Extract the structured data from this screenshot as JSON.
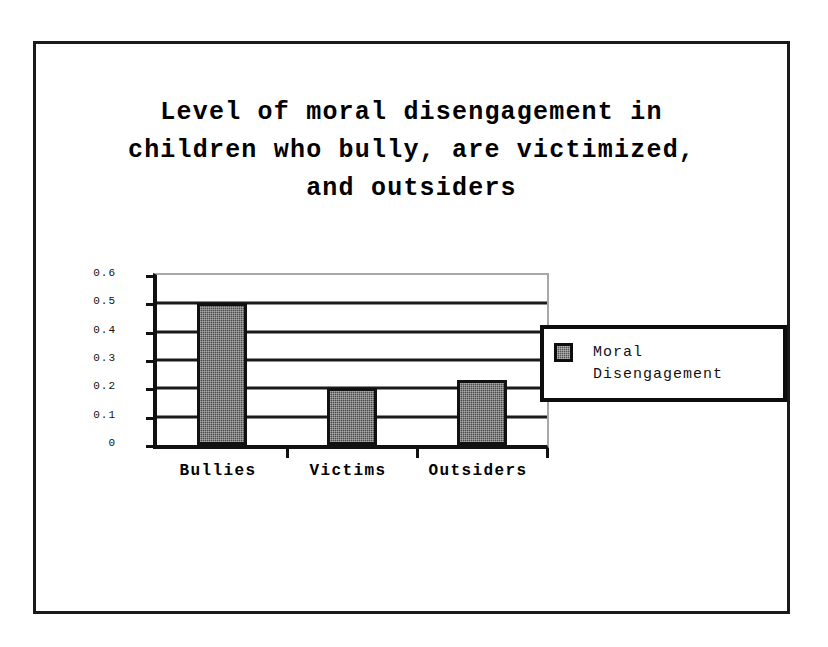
{
  "chart_data": {
    "type": "bar",
    "title": "Level of moral disengagement in\nchildren who bully, are victimized,\nand outsiders",
    "categories": [
      "Bullies",
      "Victims",
      "Outsiders"
    ],
    "values": [
      0.5,
      0.2,
      0.23
    ],
    "series": [
      {
        "name": "Moral Disengagement",
        "values": [
          0.5,
          0.2,
          0.23
        ]
      }
    ],
    "xlabel": "",
    "ylabel": "",
    "ylim": [
      0,
      0.6
    ],
    "ytick_labels": [
      "0.6",
      "0.5",
      "0.4",
      "0.3",
      "0.2",
      "0.1",
      "0"
    ],
    "ytick_values": [
      0.6,
      0.5,
      0.4,
      0.3,
      0.2,
      0.1,
      0
    ],
    "grid": true,
    "legend_position": "right",
    "legend_entries": [
      {
        "label": "Moral\nDisengagement",
        "color": "#4c4c4c"
      }
    ],
    "bar_fill_color": "#4c4c4c",
    "bar_border_color": "#111111",
    "frame_color": "#1a1a1a",
    "background_color": "#ffffff"
  }
}
